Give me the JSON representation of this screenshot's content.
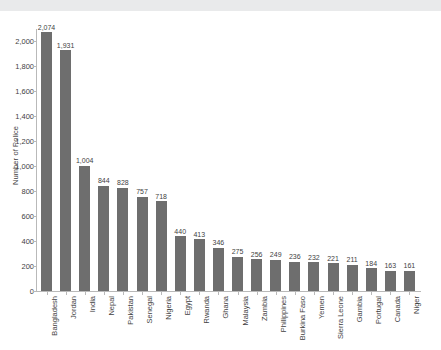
{
  "chart_data": {
    "type": "bar",
    "title": "",
    "xlabel": "",
    "ylabel": "Number of Police",
    "ylim": [
      0,
      2100
    ],
    "ytick_values": [
      0,
      200,
      400,
      600,
      800,
      1000,
      1200,
      1400,
      1600,
      1800,
      2000
    ],
    "ytick_labels": [
      "0",
      "200",
      "400",
      "600",
      "800",
      "1,000",
      "1,200",
      "1,400",
      "1,600",
      "1,800",
      "2,000"
    ],
    "grid": false,
    "legend": null,
    "bar_color": "#6e6e6e",
    "data_labels": true,
    "categories": [
      "Bangladesh",
      "Jordan",
      "India",
      "Nepal",
      "Pakistan",
      "Senegal",
      "Nigeria",
      "Egypt",
      "Rwanda",
      "Ghana",
      "Malaysia",
      "Zambia",
      "Philippines",
      "Burkina Faso",
      "Yemen",
      "Sierra Leone",
      "Gambia",
      "Portugal",
      "Canada",
      "Niger"
    ],
    "values": [
      2074,
      1931,
      1004,
      844,
      828,
      757,
      718,
      440,
      413,
      346,
      275,
      256,
      249,
      236,
      232,
      221,
      211,
      184,
      163,
      161
    ],
    "value_labels": [
      "2,074",
      "1,931",
      "1,004",
      "844",
      "828",
      "757",
      "718",
      "440",
      "413",
      "346",
      "275",
      "256",
      "249",
      "236",
      "232",
      "221",
      "211",
      "184",
      "163",
      "161"
    ]
  }
}
